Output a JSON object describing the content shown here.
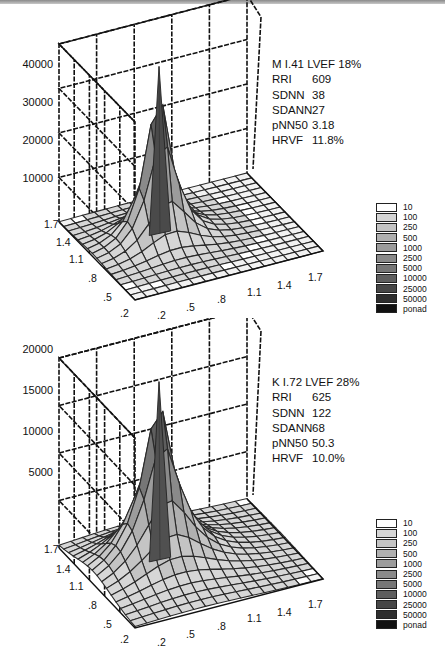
{
  "chart_data": [
    {
      "type": "surface3d",
      "title": "M I.41 LVEF 18%",
      "zlabel": "",
      "z_ticks": [
        "40000",
        "30000",
        "20000",
        "10000"
      ],
      "zlim": [
        0,
        40000
      ],
      "x_ticks": [
        ".2",
        ".5",
        ".8",
        "1.1",
        "1.4",
        "1.7"
      ],
      "y_ticks": [
        ".2",
        ".5",
        ".8",
        "1.1",
        "1.4",
        "1.7"
      ],
      "grid": true,
      "peak": {
        "x": 0.7,
        "y": 0.7,
        "z": 39000
      },
      "annotation": {
        "header": "M I.41 LVEF 18%",
        "rows": [
          {
            "key": "RRI",
            "value": "609"
          },
          {
            "key": "SDNN",
            "value": "38"
          },
          {
            "key": "SDANN",
            "value": "27"
          },
          {
            "key": "pNN50",
            "value": "3.18"
          },
          {
            "key": "HRVF",
            "value": "11.8%"
          }
        ]
      },
      "legend_position": "right"
    },
    {
      "type": "surface3d",
      "title": "K I.72 LVEF 28%",
      "zlabel": "",
      "z_ticks": [
        "20000",
        "15000",
        "10000",
        "5000"
      ],
      "zlim": [
        0,
        20000
      ],
      "x_ticks": [
        ".2",
        ".5",
        ".8",
        "1.1",
        "1.4",
        "1.7"
      ],
      "y_ticks": [
        ".2",
        ".5",
        ".8",
        "1.1",
        "1.4",
        "1.7"
      ],
      "grid": true,
      "peak": {
        "x": 0.7,
        "y": 0.7,
        "z": 19500
      },
      "annotation": {
        "header": "K I.72 LVEF 28%",
        "rows": [
          {
            "key": "RRI",
            "value": "625"
          },
          {
            "key": "SDNN",
            "value": "122"
          },
          {
            "key": "SDANN",
            "value": "68"
          },
          {
            "key": "pNN50",
            "value": "50.3"
          },
          {
            "key": "HRVF",
            "value": "10.0%"
          }
        ]
      },
      "legend_position": "right"
    }
  ],
  "legend": {
    "entries": [
      {
        "label": "10",
        "color": "#ffffff"
      },
      {
        "label": "100",
        "color": "#d6d6d6"
      },
      {
        "label": "250",
        "color": "#c4c4c4"
      },
      {
        "label": "500",
        "color": "#b0b0b0"
      },
      {
        "label": "1000",
        "color": "#9c9c9c"
      },
      {
        "label": "2500",
        "color": "#8a8a8a"
      },
      {
        "label": "5000",
        "color": "#767676"
      },
      {
        "label": "10000",
        "color": "#5e5e5e"
      },
      {
        "label": "25000",
        "color": "#464646"
      },
      {
        "label": "50000",
        "color": "#2e2e2e"
      },
      {
        "label": "ponad",
        "color": "#111111"
      }
    ]
  }
}
